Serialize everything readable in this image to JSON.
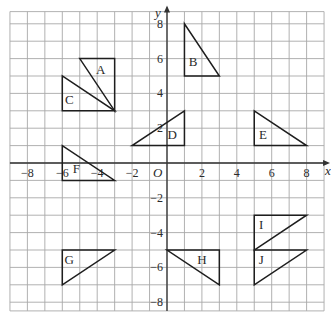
{
  "figure": {
    "axis_labels": {
      "x": "x",
      "y": "y",
      "origin": "O"
    },
    "grid": {
      "x_min": -9,
      "x_max": 9,
      "y_min": -8.5,
      "y_max": 8.7
    },
    "x_ticks": [
      {
        "value": -8,
        "label": "−8"
      },
      {
        "value": -6,
        "label": "−6"
      },
      {
        "value": -4,
        "label": "−4"
      },
      {
        "value": -2,
        "label": "−2"
      },
      {
        "value": 2,
        "label": "2"
      },
      {
        "value": 4,
        "label": "4"
      },
      {
        "value": 6,
        "label": "6"
      },
      {
        "value": 8,
        "label": "8"
      }
    ],
    "y_ticks": [
      {
        "value": 8,
        "label": "8"
      },
      {
        "value": 6,
        "label": "6"
      },
      {
        "value": 4,
        "label": "4"
      },
      {
        "value": 2,
        "label": "2"
      },
      {
        "value": -2,
        "label": "−2"
      },
      {
        "value": -4,
        "label": "−4"
      },
      {
        "value": -6,
        "label": "−6"
      },
      {
        "value": -8,
        "label": "−8"
      }
    ],
    "shapes": [
      {
        "label": "A",
        "points": [
          [
            -5,
            6
          ],
          [
            -3,
            6
          ],
          [
            -3,
            3
          ]
        ],
        "label_pos": [
          -3.8,
          5.1
        ]
      },
      {
        "label": "B",
        "points": [
          [
            1,
            8
          ],
          [
            1,
            5
          ],
          [
            3,
            5
          ]
        ],
        "label_pos": [
          1.5,
          5.6
        ]
      },
      {
        "label": "C",
        "points": [
          [
            -6,
            5
          ],
          [
            -6,
            3
          ],
          [
            -3,
            3
          ]
        ],
        "label_pos": [
          -5.6,
          3.4
        ]
      },
      {
        "label": "D",
        "points": [
          [
            -2,
            1
          ],
          [
            1,
            1
          ],
          [
            1,
            3
          ]
        ],
        "label_pos": [
          0.3,
          1.4
        ]
      },
      {
        "label": "E",
        "points": [
          [
            5,
            3
          ],
          [
            5,
            1
          ],
          [
            8,
            1
          ]
        ],
        "label_pos": [
          5.5,
          1.4
        ]
      },
      {
        "label": "F",
        "points": [
          [
            -6,
            1
          ],
          [
            -6,
            -1
          ],
          [
            -3,
            -1
          ]
        ],
        "label_pos": [
          -5.2,
          -0.6
        ]
      },
      {
        "label": "G",
        "points": [
          [
            -6,
            -5
          ],
          [
            -3,
            -5
          ],
          [
            -6,
            -7
          ]
        ],
        "label_pos": [
          -5.6,
          -5.8
        ]
      },
      {
        "label": "H",
        "points": [
          [
            0,
            -5
          ],
          [
            3,
            -5
          ],
          [
            3,
            -7
          ]
        ],
        "label_pos": [
          2,
          -5.8
        ]
      },
      {
        "label": "I",
        "points": [
          [
            5,
            -3
          ],
          [
            8,
            -3
          ],
          [
            5,
            -5
          ]
        ],
        "label_pos": [
          5.4,
          -3.8
        ]
      },
      {
        "label": "J",
        "points": [
          [
            5,
            -5
          ],
          [
            8,
            -5
          ],
          [
            5,
            -7
          ]
        ],
        "label_pos": [
          5.4,
          -5.8
        ]
      }
    ]
  }
}
